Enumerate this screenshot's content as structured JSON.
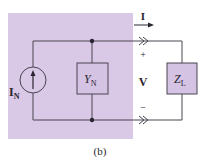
{
  "diagram": {
    "caption": "(b)",
    "shaded_region": {
      "label": "Norton equivalent",
      "color": "#d9c8e6"
    },
    "components": {
      "current_source": {
        "label": "I",
        "subscript": "N"
      },
      "admittance": {
        "label": "Y",
        "subscript": "N"
      },
      "load": {
        "label": "Z",
        "subscript": "L"
      }
    },
    "annotations": {
      "current": "I",
      "voltage": "V",
      "plus": "+",
      "minus": "−"
    },
    "colors": {
      "wire": "#4a4550",
      "shade": "#d9c8e6",
      "box_fill": "#d5c3e3",
      "text": "#2a2530"
    }
  }
}
